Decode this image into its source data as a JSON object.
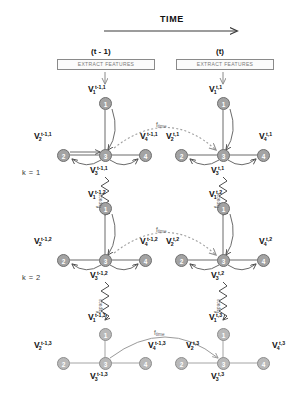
{
  "figure": {
    "title_axis": "TIME",
    "columns": [
      {
        "id": "prev",
        "label": "(t - 1)",
        "box_label": "EXTRACT FEATURES"
      },
      {
        "id": "curr",
        "label": "(t)",
        "box_label": "EXTRACT FEATURES"
      }
    ],
    "scale_labels": [
      {
        "id": "k1",
        "text": "k = 1"
      },
      {
        "id": "k2",
        "text": "k = 2"
      }
    ],
    "functions": {
      "time": {
        "base": "f",
        "sub": "time"
      },
      "space": {
        "base": "f",
        "sub": "space"
      }
    },
    "colors": {
      "node_fill": "#a3a3a3",
      "node_fill_pale": "#b9b9b9",
      "node_stroke": "#6f6f6f",
      "edge": "#6b6b6b",
      "edge_pale": "#9a9a9a",
      "dashed_arc": "#a0a0a0",
      "text": "#111111",
      "muted_text": "#7a7a7a"
    }
  },
  "graphs": [
    {
      "id": "g-prev-k1",
      "time": "t-1",
      "k": 1,
      "nodes": [
        {
          "id": "n1",
          "num": "1",
          "base": "V",
          "sub": "1",
          "sup": "t-1,1"
        },
        {
          "id": "n2",
          "num": "2",
          "base": "V",
          "sub": "2",
          "sup": "t-1,1"
        },
        {
          "id": "n3",
          "num": "3",
          "base": "V",
          "sub": "3",
          "sup": "t-1,1"
        },
        {
          "id": "n4",
          "num": "4",
          "base": "V",
          "sub": "4",
          "sup": "t-1,1"
        }
      ]
    },
    {
      "id": "g-curr-k1",
      "time": "t",
      "k": 1,
      "nodes": [
        {
          "id": "n1",
          "num": "1",
          "base": "V",
          "sub": "1",
          "sup": "t,1"
        },
        {
          "id": "n2",
          "num": "2",
          "base": "V",
          "sub": "2",
          "sup": "t,1"
        },
        {
          "id": "n3",
          "num": "3",
          "base": "V",
          "sub": "3",
          "sup": "t,1"
        },
        {
          "id": "n4",
          "num": "4",
          "base": "V",
          "sub": "4",
          "sup": "t,1"
        }
      ]
    },
    {
      "id": "g-prev-k2",
      "time": "t-1",
      "k": 2,
      "nodes": [
        {
          "id": "n1",
          "num": "1",
          "base": "V",
          "sub": "1",
          "sup": "t-1,2"
        },
        {
          "id": "n2",
          "num": "2",
          "base": "V",
          "sub": "2",
          "sup": "t-1,2"
        },
        {
          "id": "n3",
          "num": "3",
          "base": "V",
          "sub": "3",
          "sup": "t-1,2"
        },
        {
          "id": "n4",
          "num": "4",
          "base": "V",
          "sub": "4",
          "sup": "t-1,2"
        }
      ]
    },
    {
      "id": "g-curr-k2",
      "time": "t",
      "k": 2,
      "nodes": [
        {
          "id": "n1",
          "num": "1",
          "base": "V",
          "sub": "1",
          "sup": "t,2"
        },
        {
          "id": "n2",
          "num": "2",
          "base": "V",
          "sub": "2",
          "sup": "t,2"
        },
        {
          "id": "n3",
          "num": "3",
          "base": "V",
          "sub": "3",
          "sup": "t,2"
        },
        {
          "id": "n4",
          "num": "4",
          "base": "V",
          "sub": "4",
          "sup": "t,2"
        }
      ]
    },
    {
      "id": "g-prev-k3",
      "time": "t-1",
      "k": 3,
      "nodes": [
        {
          "id": "n1",
          "num": "1",
          "base": "V",
          "sub": "1",
          "sup": "t-1,3"
        },
        {
          "id": "n2",
          "num": "2",
          "base": "V",
          "sub": "2",
          "sup": "t-1,3"
        },
        {
          "id": "n3",
          "num": "3",
          "base": "V",
          "sub": "3",
          "sup": "t-1,3"
        },
        {
          "id": "n4",
          "num": "4",
          "base": "V",
          "sub": "4",
          "sup": "t-1,3"
        }
      ]
    },
    {
      "id": "g-curr-k3",
      "time": "t",
      "k": 3,
      "nodes": [
        {
          "id": "n1",
          "num": "1",
          "base": "V",
          "sub": "1",
          "sup": "t,3"
        },
        {
          "id": "n2",
          "num": "2",
          "base": "V",
          "sub": "2",
          "sup": "t,3"
        },
        {
          "id": "n3",
          "num": "3",
          "base": "V",
          "sub": "3",
          "sup": "t,3"
        },
        {
          "id": "n4",
          "num": "4",
          "base": "V",
          "sub": "4",
          "sup": "t,3"
        }
      ]
    }
  ],
  "spring_labels": [
    {
      "id": "sp-prev-1",
      "base": "f",
      "sub": "space"
    },
    {
      "id": "sp-curr-1",
      "base": "f",
      "sub": "space"
    },
    {
      "id": "sp-prev-2",
      "base": "f",
      "sub": "space"
    },
    {
      "id": "sp-curr-2",
      "base": "f",
      "sub": "space"
    }
  ],
  "time_arc_labels": [
    {
      "id": "ft-k1",
      "base": "f",
      "sub": "time"
    },
    {
      "id": "ft-k2",
      "base": "f",
      "sub": "time"
    },
    {
      "id": "ft-k3",
      "base": "f",
      "sub": "time"
    }
  ]
}
